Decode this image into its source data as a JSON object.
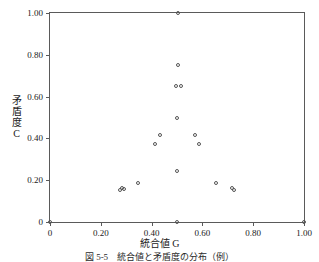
{
  "chart_data": {
    "type": "scatter",
    "title": "",
    "xlabel": "統合値 G",
    "ylabel": "矛盾度 C",
    "ylabel_chars": [
      "矛",
      "盾",
      "度",
      "C"
    ],
    "xlim": [
      0,
      1.0
    ],
    "ylim": [
      0,
      1.05
    ],
    "grid": false,
    "legend": null,
    "xticks": [
      0,
      0.2,
      0.4,
      0.6,
      0.8,
      1.0
    ],
    "xtick_labels": [
      "0",
      "0.20",
      "0.40",
      "0.60",
      "0.80",
      "1.00"
    ],
    "yticks": [
      0,
      0.2,
      0.4,
      0.6,
      0.8,
      1.0
    ],
    "ytick_labels": [
      "0",
      "0.20",
      "0.40",
      "0.60",
      "0.80",
      "1.00"
    ],
    "marker": "open-circle",
    "marker_color": "#555555",
    "points": [
      {
        "x": 0.0,
        "y": 0.0
      },
      {
        "x": 0.275,
        "y": 0.155
      },
      {
        "x": 0.285,
        "y": 0.165
      },
      {
        "x": 0.29,
        "y": 0.16
      },
      {
        "x": 0.345,
        "y": 0.185
      },
      {
        "x": 0.415,
        "y": 0.375
      },
      {
        "x": 0.435,
        "y": 0.415
      },
      {
        "x": 0.5,
        "y": 0.0
      },
      {
        "x": 0.5,
        "y": 0.245
      },
      {
        "x": 0.5,
        "y": 0.5
      },
      {
        "x": 0.495,
        "y": 0.65
      },
      {
        "x": 0.515,
        "y": 0.65
      },
      {
        "x": 0.505,
        "y": 0.75
      },
      {
        "x": 0.505,
        "y": 1.0
      },
      {
        "x": 0.57,
        "y": 0.415
      },
      {
        "x": 0.585,
        "y": 0.375
      },
      {
        "x": 0.655,
        "y": 0.185
      },
      {
        "x": 0.715,
        "y": 0.165
      },
      {
        "x": 0.725,
        "y": 0.155
      },
      {
        "x": 1.0,
        "y": 0.0
      }
    ]
  },
  "caption": "図 5-5　統合値と矛盾度の分布（例）"
}
